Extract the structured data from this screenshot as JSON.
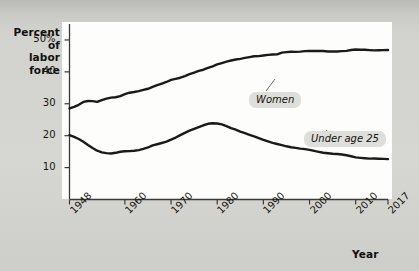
{
  "chart_data": {
    "type": "line",
    "title": "",
    "xlabel": "Year",
    "ylabel": "Percent of labor force",
    "xlim": [
      1948,
      2017
    ],
    "ylim": [
      0,
      55
    ],
    "grid": false,
    "legend_position": "inline-callouts",
    "y_ticks": [
      "50%",
      "40",
      "30",
      "20",
      "10"
    ],
    "y_tick_values": [
      50,
      40,
      30,
      20,
      10
    ],
    "x_ticks": [
      "1948",
      "1960",
      "1970",
      "1980",
      "1990",
      "2000",
      "2010",
      "2017"
    ],
    "x_tick_values": [
      1948,
      1960,
      1970,
      1980,
      1990,
      2000,
      2010,
      2017
    ],
    "annotations": [
      {
        "label": "Women",
        "x": 1993,
        "y": 45.5
      },
      {
        "label": "Under age 25",
        "x": 2007,
        "y": 13.5
      }
    ],
    "series": [
      {
        "name": "Women",
        "x": [
          1948,
          1949,
          1950,
          1951,
          1952,
          1953,
          1954,
          1955,
          1956,
          1957,
          1958,
          1959,
          1960,
          1961,
          1962,
          1963,
          1964,
          1965,
          1966,
          1967,
          1968,
          1969,
          1970,
          1971,
          1972,
          1973,
          1974,
          1975,
          1976,
          1977,
          1978,
          1979,
          1980,
          1981,
          1982,
          1983,
          1984,
          1985,
          1986,
          1987,
          1988,
          1989,
          1990,
          1991,
          1992,
          1993,
          1994,
          1995,
          1996,
          1997,
          1998,
          1999,
          2000,
          2001,
          2002,
          2003,
          2004,
          2005,
          2006,
          2007,
          2008,
          2009,
          2010,
          2011,
          2012,
          2013,
          2014,
          2015,
          2016,
          2017
        ],
        "values": [
          28.6,
          29.0,
          29.6,
          30.5,
          30.8,
          30.8,
          30.6,
          31.2,
          31.7,
          32.0,
          32.1,
          32.4,
          33.0,
          33.4,
          33.6,
          33.9,
          34.3,
          34.7,
          35.3,
          35.9,
          36.4,
          36.9,
          37.5,
          37.8,
          38.1,
          38.6,
          39.2,
          39.7,
          40.3,
          40.7,
          41.3,
          41.8,
          42.4,
          42.8,
          43.2,
          43.5,
          43.8,
          44.0,
          44.3,
          44.6,
          44.9,
          45.0,
          45.2,
          45.4,
          45.5,
          45.5,
          46.0,
          46.1,
          46.2,
          46.2,
          46.3,
          46.5,
          46.6,
          46.6,
          46.6,
          46.6,
          46.4,
          46.4,
          46.3,
          46.4,
          46.5,
          46.8,
          47.0,
          47.0,
          47.0,
          46.9,
          46.8,
          46.8,
          46.8,
          46.8
        ]
      },
      {
        "name": "Under age 25",
        "x": [
          1948,
          1949,
          1950,
          1951,
          1952,
          1953,
          1954,
          1955,
          1956,
          1957,
          1958,
          1959,
          1960,
          1961,
          1962,
          1963,
          1964,
          1965,
          1966,
          1967,
          1968,
          1969,
          1970,
          1971,
          1972,
          1973,
          1974,
          1975,
          1976,
          1977,
          1978,
          1979,
          1980,
          1981,
          1982,
          1983,
          1984,
          1985,
          1986,
          1987,
          1988,
          1989,
          1990,
          1991,
          1992,
          1993,
          1994,
          1995,
          1996,
          1997,
          1998,
          1999,
          2000,
          2001,
          2002,
          2003,
          2004,
          2005,
          2006,
          2007,
          2008,
          2009,
          2010,
          2011,
          2012,
          2013,
          2014,
          2015,
          2016,
          2017
        ],
        "values": [
          20.2,
          19.6,
          18.9,
          18.0,
          17.0,
          16.1,
          15.3,
          14.8,
          14.6,
          14.5,
          14.7,
          15.0,
          15.1,
          15.1,
          15.2,
          15.4,
          15.8,
          16.3,
          17.0,
          17.4,
          17.8,
          18.2,
          18.8,
          19.4,
          20.1,
          20.8,
          21.5,
          22.1,
          22.7,
          23.3,
          23.8,
          24.0,
          23.9,
          23.6,
          23.0,
          22.3,
          21.8,
          21.2,
          20.7,
          20.2,
          19.8,
          19.3,
          18.8,
          18.3,
          17.8,
          17.4,
          17.0,
          16.6,
          16.3,
          16.1,
          15.9,
          15.8,
          15.6,
          15.3,
          15.0,
          14.7,
          14.5,
          14.3,
          14.2,
          14.0,
          13.8,
          13.5,
          13.2,
          13.1,
          13.0,
          12.9,
          12.9,
          12.8,
          12.7,
          12.6
        ]
      }
    ]
  },
  "labels": {
    "y_axis_title": "Percent of\nlabor force",
    "y_axis_title_line1": "Percent of",
    "y_axis_title_line2": "labor force",
    "x_axis_title": "Year",
    "callout_women": "Women",
    "callout_under25": "Under age 25"
  },
  "colors": {
    "line": "#1a1a18",
    "plot_background": "#fdfdfc",
    "page_background": "#d4d4d0",
    "callout_background": "#dededa",
    "text": "#15130f"
  }
}
